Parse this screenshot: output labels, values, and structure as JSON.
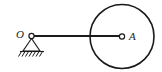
{
  "figure": {
    "type": "mechanism-diagram",
    "title": "",
    "background_color": "#ffffff",
    "stroke_color": "#1a1a1a",
    "width": 162,
    "height": 72
  },
  "labels": {
    "origin": "O",
    "center": "A"
  },
  "pin_support": {
    "name": "pin-support-O",
    "joint_center_x": 31.5,
    "joint_center_y": 36,
    "joint_radius": 2.6,
    "triangle_apex_x": 31.5,
    "triangle_apex_y": 38.5,
    "triangle_left_x": 23,
    "triangle_right_x": 40,
    "triangle_base_y": 51,
    "ground_line_x1": 20,
    "ground_line_x2": 44,
    "ground_line_y": 51.5,
    "hatch_count": 7,
    "hatch_length": 5.5
  },
  "link": {
    "name": "rigid-link-OA",
    "x1": 33,
    "y1": 36,
    "x2": 120,
    "y2": 36,
    "stroke_width": 2.2
  },
  "disk": {
    "name": "circular-disk-A",
    "center_x": 122,
    "center_y": 36.5,
    "radius": 32,
    "stroke_width": 1.6,
    "hub_radius": 2.6
  },
  "label_positions": {
    "origin_x": 20,
    "origin_y": 38,
    "origin_font_size": 11,
    "center_x": 129,
    "center_y": 40,
    "center_font_size": 11
  }
}
